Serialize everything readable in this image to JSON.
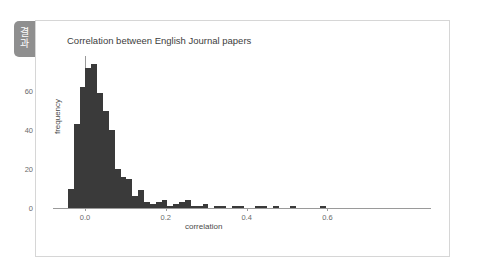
{
  "tab": {
    "label": "결과",
    "chars": [
      "결",
      "과"
    ],
    "color": "#8f8f8f"
  },
  "card": {
    "background": "#ffffff",
    "border_color": "#d6d6d6"
  },
  "chart_data": {
    "type": "bar",
    "subtype": "histogram",
    "title": "Correlation between English Journal papers",
    "xlabel": "correlation",
    "ylabel": "frequency",
    "grid": false,
    "legend": null,
    "bar_color": "#3a3a3a",
    "axis_color": "#9a9a9a",
    "xlim": [
      -0.062,
      0.665
    ],
    "ylim": [
      0,
      78
    ],
    "xticks": [
      0.0,
      0.2,
      0.4,
      0.6
    ],
    "xtick_labels": [
      "0.0",
      "0.2",
      "0.4",
      "0.6"
    ],
    "yticks": [
      0,
      20,
      40,
      60
    ],
    "ytick_labels": [
      "0",
      "20",
      "40",
      "60"
    ],
    "bin_width": 0.0145,
    "bin_start": -0.0425,
    "bin_edges": [
      -0.0425,
      -0.028,
      -0.0135,
      0.001,
      0.0155,
      0.03,
      0.0445,
      0.059,
      0.0735,
      0.088,
      0.1025,
      0.117,
      0.1315,
      0.146,
      0.1605,
      0.175,
      0.1895,
      0.204,
      0.2185,
      0.233,
      0.2475,
      0.262,
      0.2765,
      0.291,
      0.3055,
      0.32,
      0.3345,
      0.349,
      0.3635,
      0.378,
      0.3925,
      0.407,
      0.4215,
      0.436,
      0.4505,
      0.465,
      0.4795,
      0.494,
      0.5085,
      0.523,
      0.5375,
      0.552,
      0.5665,
      0.581,
      0.5955,
      0.61,
      0.6245
    ],
    "bin_centers": [
      -0.035,
      -0.021,
      -0.006,
      0.008,
      0.023,
      0.037,
      0.052,
      0.066,
      0.081,
      0.095,
      0.11,
      0.124,
      0.139,
      0.153,
      0.168,
      0.182,
      0.197,
      0.211,
      0.226,
      0.24,
      0.255,
      0.269,
      0.284,
      0.298,
      0.313,
      0.327,
      0.342,
      0.356,
      0.371,
      0.385,
      0.4,
      0.414,
      0.429,
      0.443,
      0.458,
      0.472,
      0.487,
      0.501,
      0.516,
      0.53,
      0.545,
      0.559,
      0.574,
      0.588,
      0.603,
      0.617
    ],
    "categories": [
      "-0.035",
      "-0.021",
      "-0.006",
      "0.008",
      "0.023",
      "0.037",
      "0.052",
      "0.066",
      "0.081",
      "0.095",
      "0.110",
      "0.124",
      "0.139",
      "0.153",
      "0.168",
      "0.182",
      "0.197",
      "0.211",
      "0.226",
      "0.240",
      "0.255",
      "0.269",
      "0.284",
      "0.298",
      "0.313",
      "0.327",
      "0.342",
      "0.356",
      "0.371",
      "0.385",
      "0.400",
      "0.414",
      "0.429",
      "0.443",
      "0.458",
      "0.472",
      "0.487",
      "0.501",
      "0.516",
      "0.530",
      "0.545",
      "0.559",
      "0.574",
      "0.588",
      "0.603",
      "0.617"
    ],
    "values": [
      10,
      43,
      62,
      72,
      74,
      59,
      50,
      40,
      20,
      16,
      15,
      6,
      9,
      3,
      2,
      3,
      4,
      1,
      2,
      3,
      4,
      1,
      1,
      2,
      0,
      1,
      1,
      0,
      1,
      1,
      0,
      0,
      1,
      1,
      0,
      1,
      0,
      0,
      1,
      0,
      0,
      0,
      0,
      1,
      0,
      0
    ],
    "peak_value": 74,
    "peak_center": 0.023
  }
}
